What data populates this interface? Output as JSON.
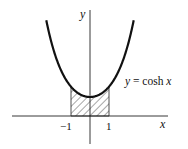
{
  "figure": {
    "function_label": "y = cosh x",
    "x_axis_label": "x",
    "y_axis_label": "y",
    "ticks": [
      "−1",
      "1"
    ],
    "shaded_region": {
      "from": -1,
      "to": 1
    }
  },
  "colors": {
    "ink": "#111111",
    "background": "#ffffff"
  }
}
